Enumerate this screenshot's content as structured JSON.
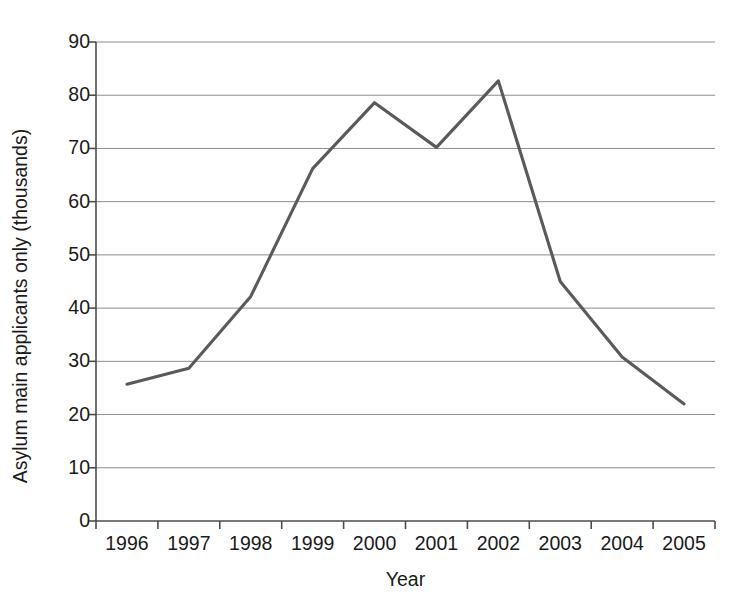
{
  "chart_data": {
    "type": "line",
    "title": "",
    "xlabel": "Year",
    "ylabel": "Asylum main applicants only (thousands)",
    "categories": [
      "1996",
      "1997",
      "1998",
      "1999",
      "2000",
      "2001",
      "2002",
      "2003",
      "2004",
      "2005"
    ],
    "x": [
      1996,
      1997,
      1998,
      1999,
      2000,
      2001,
      2002,
      2003,
      2004,
      2005
    ],
    "values": [
      25.7,
      28.7,
      42.2,
      66.2,
      78.6,
      70.2,
      82.7,
      45.0,
      30.8,
      22.0
    ],
    "series": [
      {
        "name": "Asylum main applicants",
        "values": [
          25.7,
          28.7,
          42.2,
          66.2,
          78.6,
          70.2,
          82.7,
          45.0,
          30.8,
          22.0
        ],
        "color": "#5a5a5a"
      }
    ],
    "ylim": [
      0,
      90
    ],
    "yticks": [
      0,
      10,
      20,
      30,
      40,
      50,
      60,
      70,
      80,
      90
    ],
    "ytick_labels": [
      "0",
      "10",
      "20",
      "30",
      "40",
      "50",
      "60",
      "70",
      "80",
      "90"
    ],
    "xtick_labels": [
      "1996",
      "1997",
      "1998",
      "1999",
      "2000",
      "2001",
      "2002",
      "2003",
      "2004",
      "2005"
    ],
    "grid": "horizontal",
    "legend": "none",
    "annotations": [],
    "colors": {
      "line": "#5a5a5a",
      "gridline": "#8c8c8c",
      "axis": "#4d4d4d",
      "text": "#1a1a1a",
      "background": "#ffffff"
    }
  },
  "axis_titles": {
    "y": "Asylum main applicants only (thousands)",
    "x": "Year"
  }
}
